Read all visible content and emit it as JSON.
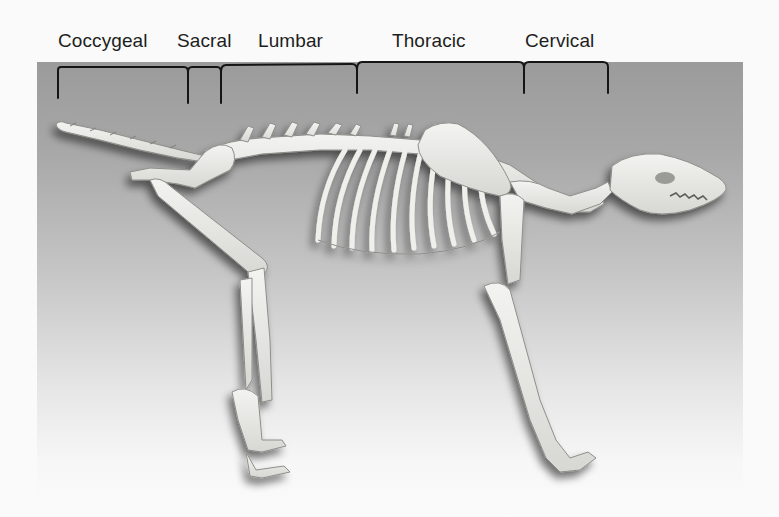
{
  "figure": {
    "background": {
      "top_color": "#9b9b9b",
      "bottom_color": "#fbfbfb"
    },
    "regions": [
      {
        "label": "Coccygeal",
        "label_x": 58,
        "bracket_start": 58,
        "bracket_end": 188
      },
      {
        "label": "Sacral",
        "label_x": 177,
        "bracket_start": 188,
        "bracket_end": 221
      },
      {
        "label": "Lumbar",
        "label_x": 258,
        "bracket_start": 221,
        "bracket_end": 357
      },
      {
        "label": "Thoracic",
        "label_x": 392,
        "bracket_start": 357,
        "bracket_end": 524
      },
      {
        "label": "Cervical",
        "label_x": 525,
        "bracket_start": 524,
        "bracket_end": 608
      }
    ]
  }
}
